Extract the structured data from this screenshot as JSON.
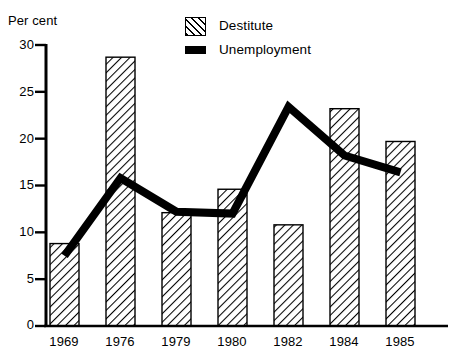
{
  "chart_data": {
    "type": "bar",
    "title": "",
    "subtitle": "",
    "xlabel": "",
    "ylabel": "Per cent",
    "categories": [
      "1969",
      "1976",
      "1979",
      "1980",
      "1982",
      "1984",
      "1985"
    ],
    "ylim": [
      0,
      30
    ],
    "yticks": [
      0,
      5,
      10,
      15,
      20,
      25,
      30
    ],
    "ytick_labels": [
      "0",
      "5",
      "10",
      "15",
      "20",
      "25",
      "30"
    ],
    "grid": false,
    "legend_position": "top-center",
    "series": [
      {
        "name": "Destitute",
        "type": "bar",
        "fill": "diagonal-hatch",
        "color": "#000000",
        "values": [
          8.8,
          28.7,
          12.1,
          14.6,
          10.8,
          23.2,
          19.7
        ]
      },
      {
        "name": "Unemployment",
        "type": "line",
        "color": "#000000",
        "values": [
          7.5,
          15.8,
          12.2,
          12.0,
          23.4,
          18.2,
          16.4
        ]
      }
    ]
  },
  "legend": {
    "items": [
      {
        "label": "Destitute",
        "swatch": "hatch-swatch-icon"
      },
      {
        "label": "Unemployment",
        "swatch": "line-swatch-icon"
      }
    ]
  },
  "axes": {
    "y_title": "Per cent"
  }
}
